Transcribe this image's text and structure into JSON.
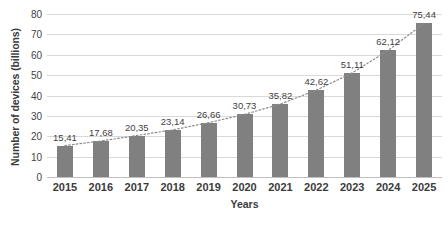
{
  "chart_data": {
    "type": "bar",
    "title": "",
    "xlabel": "Years",
    "ylabel": "Number of devices (billions)",
    "categories": [
      "2015",
      "2016",
      "2017",
      "2018",
      "2019",
      "2020",
      "2021",
      "2022",
      "2023",
      "2024",
      "2025"
    ],
    "values": [
      15.41,
      17.68,
      20.35,
      23.14,
      26.66,
      30.73,
      35.82,
      42.62,
      51.11,
      62.12,
      75.44
    ],
    "data_labels": [
      "15,41",
      "17,68",
      "20,35",
      "23,14",
      "26,66",
      "30,73",
      "35,82",
      "42,62",
      "51,11",
      "62,12",
      "75,44"
    ],
    "ylim": [
      0,
      80
    ],
    "yticks": [
      0,
      10,
      20,
      30,
      40,
      50,
      60,
      70,
      80
    ],
    "ytick_labels": [
      "0",
      "10",
      "20",
      "30",
      "40",
      "50",
      "60",
      "70",
      "80"
    ],
    "grid": true,
    "legend": false,
    "bar_color": "#808080",
    "gridline_color": "#d9d9d9",
    "text_color": "#3b3b3b",
    "trendline": {
      "present": true,
      "style": "dotted",
      "color": "#8c8c8c"
    }
  }
}
